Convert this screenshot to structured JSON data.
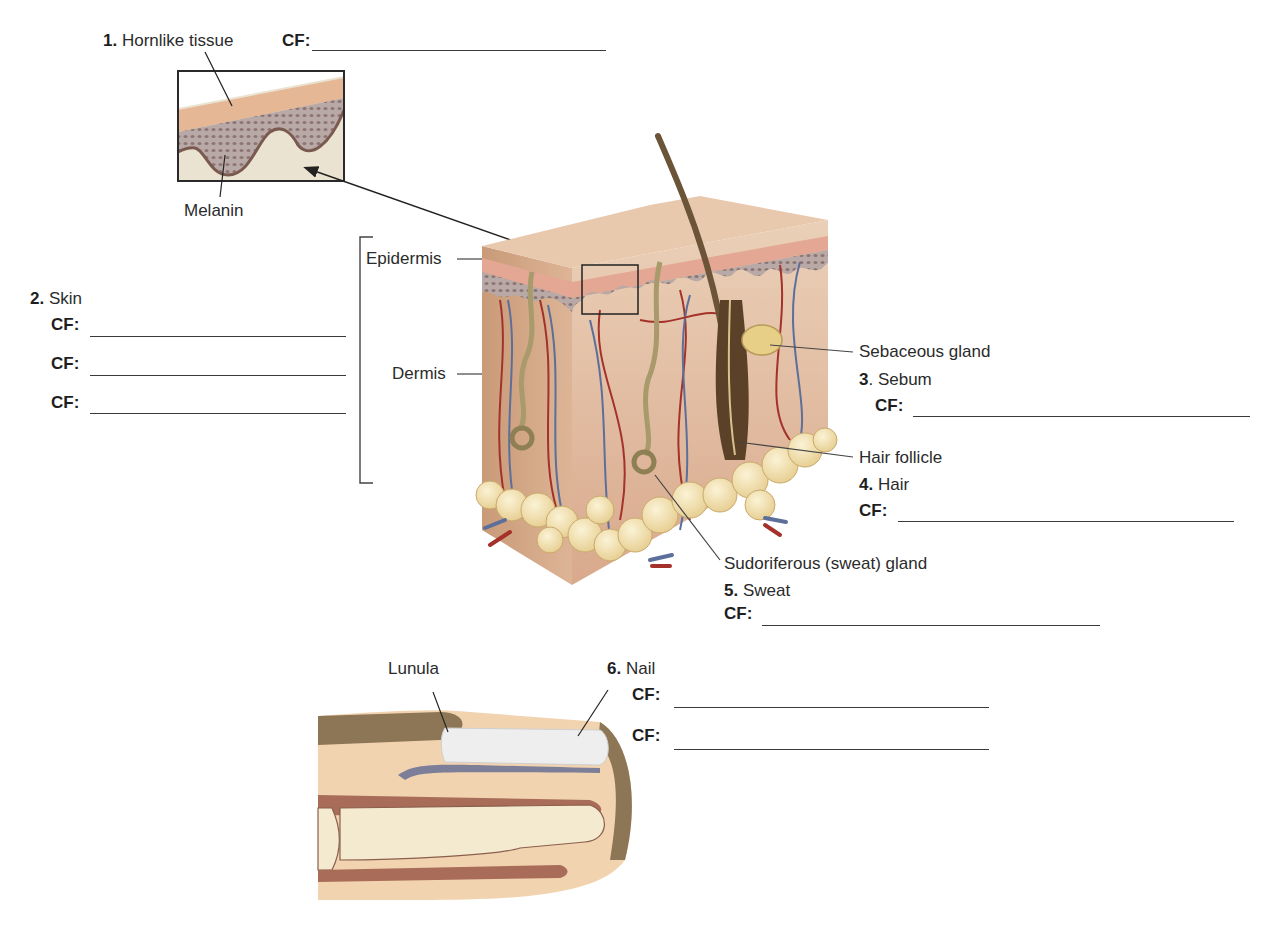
{
  "header": {
    "cut_off_text": "...g... ...s... ...e... ...y... ...d... ...h... ...g... ...pp... ..."
  },
  "items": [
    {
      "number": "1.",
      "term": "Hornlike tissue",
      "cf_label": "CF:",
      "blanks": 1
    },
    {
      "number": "2.",
      "term": "Skin",
      "cf_label": "CF:",
      "blanks": 3
    },
    {
      "number": "3",
      "term": ". Sebum",
      "cf_label": "CF:",
      "blanks": 1
    },
    {
      "number": "4.",
      "term": "Hair",
      "cf_label": "CF:",
      "blanks": 1
    },
    {
      "number": "5.",
      "term": "Sweat",
      "cf_label": "CF:",
      "blanks": 1
    },
    {
      "number": "6.",
      "term": "Nail",
      "cf_label": "CF:",
      "blanks": 2
    }
  ],
  "structure_labels": {
    "melanin": "Melanin",
    "epidermis": "Epidermis",
    "dermis": "Dermis",
    "sebaceous_gland": "Sebaceous gland",
    "hair_follicle": "Hair follicle",
    "sudoriferous_gland": "Sudoriferous (sweat) gland",
    "lunula": "Lunula"
  },
  "colors": {
    "skin_surface": "#e9c9ae",
    "stratum_corneum": "#e3a793",
    "basal_layer": "#8a7070",
    "dermis": "#e6c1a6",
    "fat": "#f3e2b3",
    "artery": "#a4322a",
    "vein": "#5b6f9a",
    "hair": "#6b5437",
    "nail": "#eeeeee",
    "bone": "#f3ead0"
  }
}
